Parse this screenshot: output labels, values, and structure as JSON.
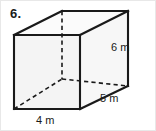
{
  "page": {
    "background_color": "#ffffff",
    "width": 156,
    "height": 131
  },
  "problem": {
    "number_label": "6."
  },
  "figure": {
    "name": "rectangular-prism",
    "edge_color": "#1a1a1a",
    "face_fill_front": "#f4f4f4",
    "face_fill_side": "#f7f7f7",
    "face_fill_top": "#fbfbfb",
    "hidden_edge_color": "#1a1a1a",
    "vertices": {
      "front_top_left": [
        13,
        34
      ],
      "front_top_right": [
        79,
        34
      ],
      "front_bottom_right": [
        79,
        108
      ],
      "front_bottom_left": [
        13,
        108
      ],
      "back_top_left": [
        61,
        10
      ],
      "back_top_right": [
        127,
        10
      ],
      "back_bottom_right": [
        127,
        85
      ],
      "back_bottom_left": [
        61,
        78
      ]
    }
  },
  "labels": {
    "height": "6 m",
    "depth": "5 m",
    "width": "4 m"
  },
  "measurements": {
    "height_value": 6,
    "depth_value": 5,
    "width_value": 4,
    "unit": "m"
  }
}
